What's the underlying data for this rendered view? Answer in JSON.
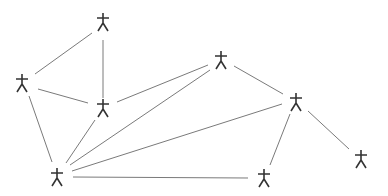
{
  "diagram": {
    "type": "network-graph",
    "node_icon": "actor-stick-figure-icon",
    "colors": {
      "background": "#ffffff",
      "edge": "#7a7a7a",
      "actor": "#333333"
    },
    "nodes": [
      {
        "id": "A",
        "x": 103,
        "y": 22
      },
      {
        "id": "B",
        "x": 22,
        "y": 83
      },
      {
        "id": "C",
        "x": 103,
        "y": 108
      },
      {
        "id": "D",
        "x": 221,
        "y": 60
      },
      {
        "id": "E",
        "x": 296,
        "y": 102
      },
      {
        "id": "F",
        "x": 361,
        "y": 159
      },
      {
        "id": "G",
        "x": 264,
        "y": 178
      },
      {
        "id": "H",
        "x": 57,
        "y": 177
      }
    ],
    "edges": [
      {
        "from": "A",
        "to": "B",
        "x1": 92,
        "y1": 33,
        "x2": 35,
        "y2": 74
      },
      {
        "from": "A",
        "to": "C",
        "x1": 103,
        "y1": 40,
        "x2": 103,
        "y2": 98
      },
      {
        "from": "B",
        "to": "C",
        "x1": 38,
        "y1": 89,
        "x2": 88,
        "y2": 103
      },
      {
        "from": "B",
        "to": "H",
        "x1": 29,
        "y1": 96,
        "x2": 52,
        "y2": 162
      },
      {
        "from": "C",
        "to": "D",
        "x1": 117,
        "y1": 102,
        "x2": 208,
        "y2": 65
      },
      {
        "from": "C",
        "to": "H",
        "x1": 95,
        "y1": 120,
        "x2": 66,
        "y2": 163
      },
      {
        "from": "D",
        "to": "H",
        "x1": 210,
        "y1": 70,
        "x2": 70,
        "y2": 165
      },
      {
        "from": "E",
        "to": "H",
        "x1": 282,
        "y1": 104,
        "x2": 72,
        "y2": 171
      },
      {
        "from": "H",
        "to": "G",
        "x1": 73,
        "y1": 177,
        "x2": 248,
        "y2": 178
      },
      {
        "from": "E",
        "to": "G",
        "x1": 290,
        "y1": 114,
        "x2": 270,
        "y2": 165
      },
      {
        "from": "E",
        "to": "F",
        "x1": 308,
        "y1": 111,
        "x2": 349,
        "y2": 149
      },
      {
        "from": "D",
        "to": "E",
        "x1": 234,
        "y1": 66,
        "x2": 283,
        "y2": 94
      }
    ]
  }
}
